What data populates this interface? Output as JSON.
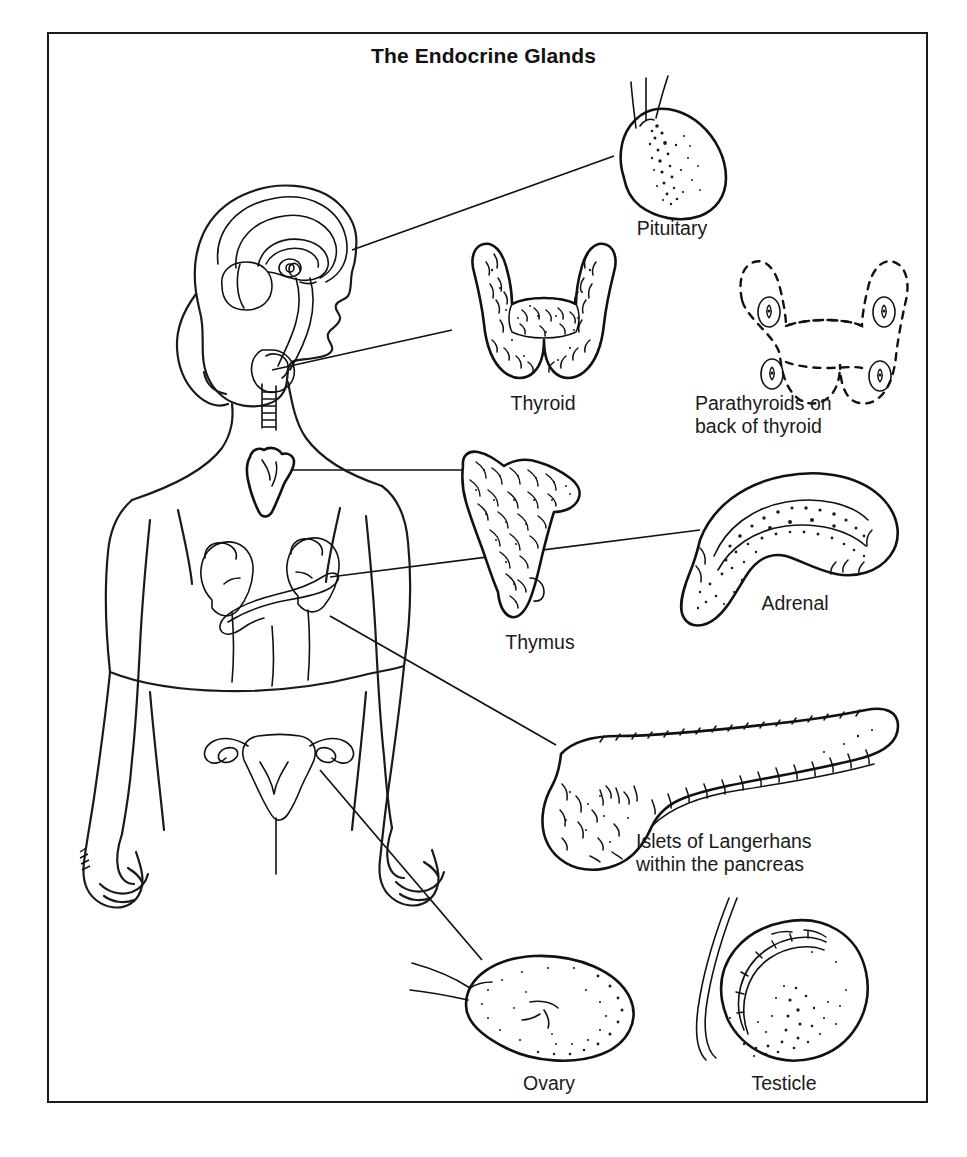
{
  "figure": {
    "title": "The Endocrine Glands",
    "border_color": "#1a1a1a",
    "background_color": "#ffffff",
    "ink_color": "#111111"
  },
  "glands": [
    {
      "id": "pituitary",
      "label": "Pituitary",
      "label_lines": [
        "Pituitary"
      ],
      "label_align": "center"
    },
    {
      "id": "thyroid",
      "label": "Thyroid",
      "label_lines": [
        "Thyroid"
      ],
      "label_align": "center"
    },
    {
      "id": "parathyroids",
      "label": "Parathyroids on back of thyroid",
      "label_lines": [
        "Parathyroids on",
        "back of thyroid"
      ],
      "label_align": "left"
    },
    {
      "id": "thymus",
      "label": "Thymus",
      "label_lines": [
        "Thymus"
      ],
      "label_align": "center"
    },
    {
      "id": "adrenal",
      "label": "Adrenal",
      "label_lines": [
        "Adrenal"
      ],
      "label_align": "center"
    },
    {
      "id": "pancreas",
      "label": "Islets of Langerhans within the pancreas",
      "label_lines": [
        "Islets of Langerhans",
        "within the pancreas"
      ],
      "label_align": "left"
    },
    {
      "id": "ovary",
      "label": "Ovary",
      "label_lines": [
        "Ovary"
      ],
      "label_align": "center"
    },
    {
      "id": "testicle",
      "label": "Testicle",
      "label_lines": [
        "Testicle"
      ],
      "label_align": "center"
    }
  ],
  "labels": {
    "pituitary": "Pituitary",
    "thyroid": "Thyroid",
    "parathyroids_line1": "Parathyroids on",
    "parathyroids_line2": "back of thyroid",
    "thymus": "Thymus",
    "adrenal": "Adrenal",
    "pancreas_line1": "Islets of Langerhans",
    "pancreas_line2": "within the pancreas",
    "ovary": "Ovary",
    "testicle": "Testicle"
  },
  "body_figure": {
    "description": "Female body outline, head in profile facing right, with brain cross-section, trachea, thymus, kidneys with adrenals, pancreas and uterus with ovaries"
  }
}
